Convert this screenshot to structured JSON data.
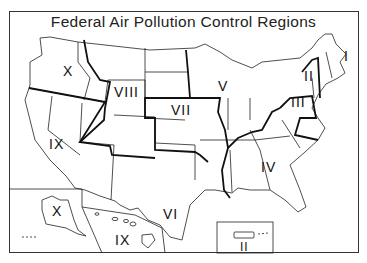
{
  "title": "Federal Air Pollution Control Regions",
  "regions": [
    {
      "label": "I",
      "x": 348,
      "y": 58
    },
    {
      "label": "II",
      "x": 306,
      "y": 75
    },
    {
      "label": "III",
      "x": 292,
      "y": 102
    },
    {
      "label": "IV",
      "x": 262,
      "y": 168
    },
    {
      "label": "V",
      "x": 218,
      "y": 87
    },
    {
      "label": "VI",
      "x": 164,
      "y": 215
    },
    {
      "label": "VII",
      "x": 172,
      "y": 111
    },
    {
      "label": "VIII",
      "x": 116,
      "y": 92
    },
    {
      "label": "IX",
      "x": 47,
      "y": 145
    },
    {
      "label": "X",
      "x": 35,
      "y": 72
    }
  ],
  "insets": [
    {
      "name": "alaska",
      "label": "X",
      "x": 50,
      "y": 240
    },
    {
      "name": "hawaii",
      "label": "IX",
      "x": 110,
      "y": 238
    },
    {
      "name": "puerto-rico",
      "label": "II",
      "x": 246,
      "y": 247
    }
  ]
}
